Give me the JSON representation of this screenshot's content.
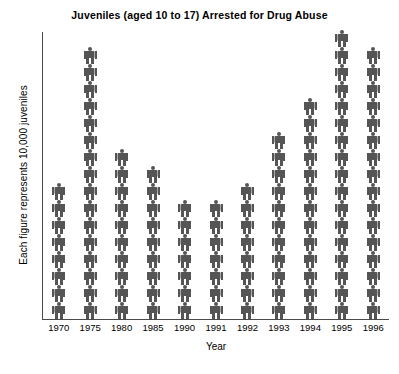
{
  "chart_data": {
    "type": "bar",
    "subtype": "pictograph",
    "title": "Juveniles (aged 10 to 17) Arrested for Drug Abuse",
    "xlabel": "Year",
    "ylabel": "Each figure represents 10,000 juveniles",
    "unit_per_figure": 10000,
    "categories": [
      "1970",
      "1975",
      "1980",
      "1985",
      "1990",
      "1991",
      "1992",
      "1993",
      "1994",
      "1995",
      "1996"
    ],
    "values": [
      8,
      16,
      10,
      9,
      7,
      7,
      8,
      11,
      13,
      17,
      16
    ],
    "values_in_juveniles": [
      80000,
      160000,
      100000,
      90000,
      70000,
      70000,
      80000,
      110000,
      130000,
      170000,
      160000
    ],
    "ylim": [
      0,
      17
    ],
    "grid": false,
    "legend": false,
    "figure_color": "#555555",
    "axis_color": "#4a4a4a",
    "text_color": "#000000",
    "background_color": "#ffffff"
  }
}
